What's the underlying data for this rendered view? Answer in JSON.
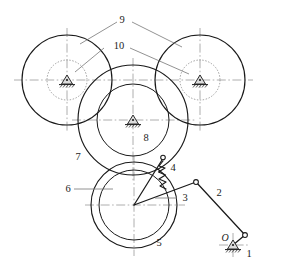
{
  "diagram": {
    "type": "kinematic-schematic",
    "canvas": {
      "width": 283,
      "height": 274
    },
    "colors": {
      "line": "#1a1a1a",
      "centerline": "#9b9b9b",
      "dotted": "#8a8a8a",
      "leader": "#6e6e6e",
      "background": "#ffffff"
    }
  },
  "labels": {
    "link_1": "1",
    "link_2": "2",
    "link_3": "3",
    "link_4": "4",
    "gear_5": "5",
    "gear_6": "6",
    "gear_7": "7",
    "gear_8": "8",
    "gear_9": "9",
    "gear_10": "10",
    "pivot_O": "O"
  },
  "members": [
    {
      "id": "1",
      "name": "frame-ground",
      "label": "1",
      "kind": "fixed-ground-pivot"
    },
    {
      "id": "2",
      "name": "crank-link-2",
      "label": "2",
      "kind": "binary-link"
    },
    {
      "id": "3",
      "name": "coupler-link-3",
      "label": "3",
      "kind": "binary-link"
    },
    {
      "id": "4",
      "name": "spring-link-4",
      "label": "4",
      "kind": "spring"
    },
    {
      "id": "5",
      "name": "gear-5",
      "label": "5",
      "kind": "gear-outer"
    },
    {
      "id": "6",
      "name": "gear-6",
      "label": "6",
      "kind": "gear-inner"
    },
    {
      "id": "7",
      "name": "ring-gear-7",
      "label": "7",
      "kind": "gear-outer"
    },
    {
      "id": "8",
      "name": "sun-gear-8",
      "label": "8",
      "kind": "gear-inner"
    },
    {
      "id": "9",
      "name": "planet-gear-9",
      "label": "9",
      "kind": "gear-outer-pair"
    },
    {
      "id": "10",
      "name": "planet-hub-10",
      "label": "10",
      "kind": "dotted-circle-pair"
    }
  ],
  "geometry": {
    "left_gear": {
      "cx": 67,
      "cy": 80,
      "r_outer": 45,
      "r_dotted": 20
    },
    "right_gear": {
      "cx": 200,
      "cy": 80,
      "r_outer": 45,
      "r_dotted": 20
    },
    "center_gear": {
      "cx": 133,
      "cy": 120,
      "r_outer": 55,
      "r_inner": 36
    },
    "bottom_gear": {
      "cx": 134,
      "cy": 205,
      "r_outer": 43,
      "r_inner": 35
    },
    "joint_spring_top": {
      "x": 163,
      "y": 158
    },
    "joint_link3_right": {
      "x": 196,
      "y": 182
    },
    "joint_link2_bottom": {
      "x": 245,
      "y": 235
    },
    "pivot_O": {
      "x": 233,
      "y": 245
    }
  }
}
